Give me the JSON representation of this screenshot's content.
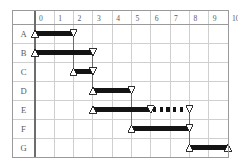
{
  "chart_data": {
    "type": "bar",
    "title": "",
    "subtitle": "",
    "xlabel": "",
    "ylabel": "",
    "orientation": "horizontal",
    "chart_style": "gantt",
    "xlim": [
      0,
      10
    ],
    "grid": true,
    "legend": "none",
    "x_ticks": [
      "0",
      "1",
      "2",
      "3",
      "4",
      "5",
      "6",
      "7",
      "8",
      "9",
      "10"
    ],
    "categories": [
      "A",
      "B",
      "C",
      "D",
      "E",
      "F",
      "G"
    ],
    "tasks": [
      {
        "id": "A",
        "label": "A",
        "start": 0,
        "end": 2,
        "duration": 2,
        "start_marker": "up-triangle",
        "end_marker": "down-triangle",
        "segments": [
          {
            "from": 0,
            "to": 2,
            "style": "solid"
          }
        ]
      },
      {
        "id": "B",
        "label": "B",
        "start": 0,
        "end": 3,
        "duration": 3,
        "start_marker": "up-triangle",
        "end_marker": "down-triangle",
        "segments": [
          {
            "from": 0,
            "to": 3,
            "style": "solid"
          }
        ]
      },
      {
        "id": "C",
        "label": "C",
        "start": 2,
        "end": 3,
        "duration": 1,
        "start_marker": "up-triangle",
        "end_marker": "down-triangle",
        "segments": [
          {
            "from": 2,
            "to": 3,
            "style": "solid"
          }
        ]
      },
      {
        "id": "D",
        "label": "D",
        "start": 3,
        "end": 5,
        "duration": 2,
        "start_marker": "up-triangle",
        "end_marker": "down-triangle",
        "segments": [
          {
            "from": 3,
            "to": 5,
            "style": "solid"
          }
        ]
      },
      {
        "id": "E",
        "label": "E",
        "start": 3,
        "end": 8,
        "duration": 5,
        "start_marker": "up-triangle",
        "end_marker": "down-triangle",
        "mid_marker": "down-triangle",
        "mid_marker_at": 6,
        "segments": [
          {
            "from": 3,
            "to": 6,
            "style": "solid"
          },
          {
            "from": 6,
            "to": 8,
            "style": "dotted"
          }
        ]
      },
      {
        "id": "F",
        "label": "F",
        "start": 5,
        "end": 8,
        "duration": 3,
        "start_marker": "up-triangle",
        "end_marker": "down-triangle",
        "segments": [
          {
            "from": 5,
            "to": 8,
            "style": "solid"
          }
        ]
      },
      {
        "id": "G",
        "label": "G",
        "start": 8,
        "end": 10,
        "duration": 2,
        "start_marker": "up-triangle",
        "end_marker": "up-triangle",
        "segments": [
          {
            "from": 8,
            "to": 10,
            "style": "solid"
          }
        ]
      }
    ],
    "dependencies": [
      {
        "from": "A",
        "from_x": 2,
        "to": "C",
        "to_x": 2
      },
      {
        "from": "B",
        "from_x": 3,
        "to": "D",
        "to_x": 3
      },
      {
        "from": "C",
        "from_x": 3,
        "to": "D",
        "to_x": 3
      },
      {
        "from": "D",
        "from_x": 5,
        "to": "F",
        "to_x": 5
      },
      {
        "from": "E",
        "from_x": 8,
        "to": "G",
        "to_x": 8
      },
      {
        "from": "F",
        "from_x": 8,
        "to": "G",
        "to_x": 8
      }
    ]
  },
  "colors": {
    "bar_fill": "#141414",
    "marker_fill": "#ffffff",
    "marker_stroke": "#1a1a1a",
    "grid_line": "#cfcfcf",
    "border": "#9a9a9a",
    "axis_divider": "#6d6d6d",
    "label_text": "#5b5b5b",
    "background": "#ffffff"
  },
  "geometry": {
    "plot_left": 35,
    "plot_right": 228,
    "plot_top": 24,
    "plot_bottom": 157,
    "label_col_left": 12,
    "header_top": 10,
    "row_height": 19,
    "bar_thickness": 5
  }
}
